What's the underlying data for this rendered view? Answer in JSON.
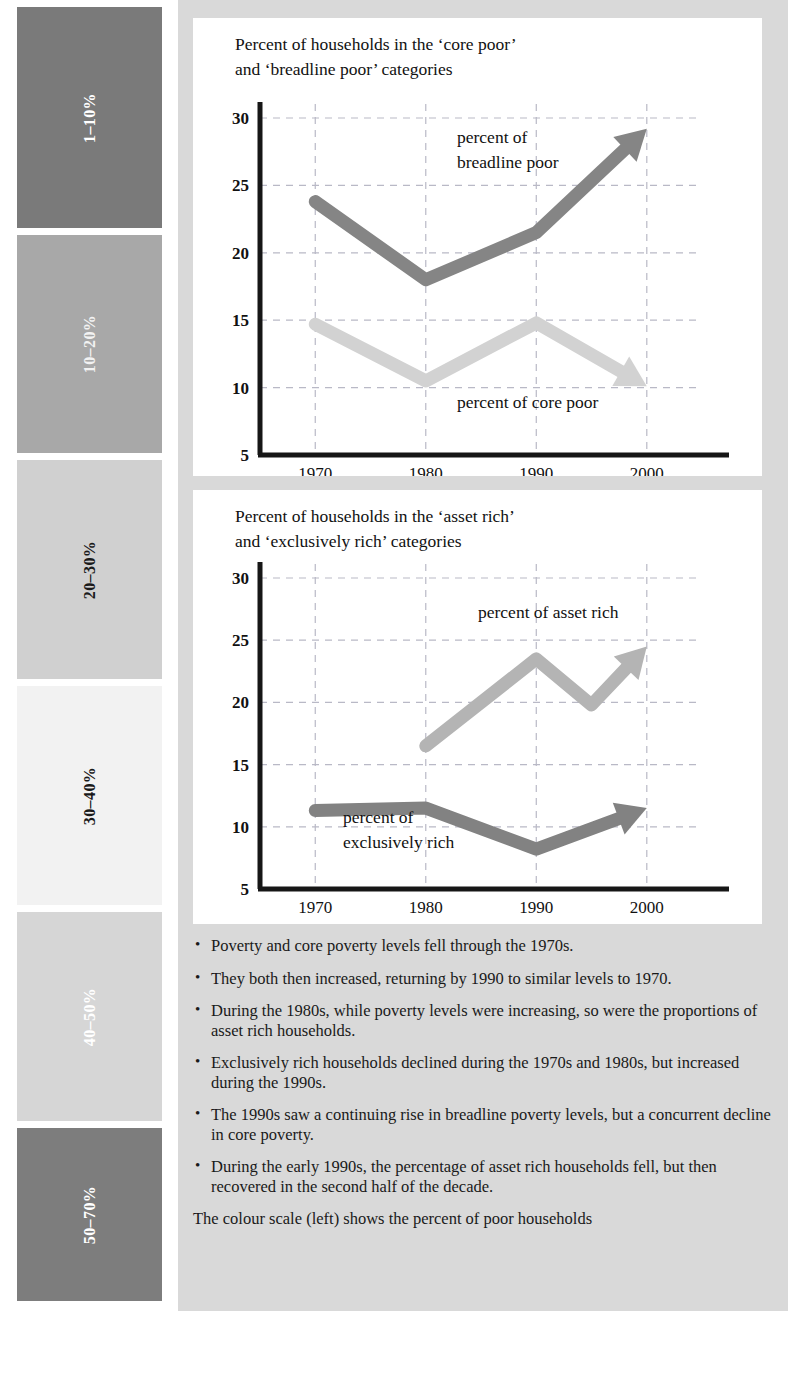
{
  "colour_scale": {
    "bands": [
      {
        "label": "1–10%",
        "color": "#7a7a7a",
        "text_color": "#ffffff",
        "top": 0,
        "height": 221
      },
      {
        "label": "10–20%",
        "color": "#a8a8a8",
        "text_color": "#f2f2f2",
        "top": 228,
        "height": 218
      },
      {
        "label": "20–30%",
        "color": "#d0d0d0",
        "text_color": "#1a1a1a",
        "top": 453,
        "height": 219
      },
      {
        "label": "30–40%",
        "color": "#f2f2f2",
        "text_color": "#1a1a1a",
        "top": 679,
        "height": 219
      },
      {
        "label": "40–50%",
        "color": "#d6d6d6",
        "text_color": "#ffffff",
        "top": 905,
        "height": 209
      },
      {
        "label": "50–70%",
        "color": "#7d7d7d",
        "text_color": "#ffffff",
        "top": 1121,
        "height": 173
      }
    ]
  },
  "charts": {
    "poor": {
      "title": "Percent of households in the ‘core poor’\nand ‘breadline poor’ categories",
      "annotations": {
        "breadline": "percent of\nbreadline poor",
        "core": "percent of core poor"
      }
    },
    "rich": {
      "title": "Percent of households in the ‘asset rich’\nand ‘exclusively rich’ categories",
      "annotations": {
        "asset": "percent of asset rich",
        "exclusive": "percent of\nexclusively rich"
      }
    }
  },
  "chart_data": [
    {
      "type": "line",
      "title": "Percent of households in the ‘core poor’ and ‘breadline poor’ categories",
      "xlabel": "",
      "ylabel": "",
      "x": [
        1970,
        1980,
        1990,
        2000
      ],
      "xticks": [
        "1970",
        "1980",
        "1990",
        "2000"
      ],
      "yticks": [
        5,
        10,
        15,
        20,
        25,
        30
      ],
      "ylim": [
        5,
        30
      ],
      "xlim": [
        1965,
        2004
      ],
      "grid": true,
      "legend": "inline-annotations",
      "series": [
        {
          "name": "percent of breadline poor",
          "color": "#858585",
          "arrow_end": true,
          "values": [
            23.8,
            18.0,
            21.5,
            29.2
          ]
        },
        {
          "name": "percent of core poor",
          "color": "#d2d2d2",
          "arrow_end": true,
          "values": [
            14.7,
            10.5,
            14.8,
            10.1
          ]
        }
      ]
    },
    {
      "type": "line",
      "title": "Percent of households in the ‘asset rich’ and ‘exclusively rich’ categories",
      "xlabel": "",
      "ylabel": "",
      "x": [
        1970,
        1980,
        1990,
        1995,
        2000
      ],
      "xticks": [
        "1970",
        "1980",
        "1990",
        "2000"
      ],
      "yticks": [
        5,
        10,
        15,
        20,
        25,
        30
      ],
      "ylim": [
        5,
        30
      ],
      "xlim": [
        1965,
        2004
      ],
      "grid": true,
      "legend": "inline-annotations",
      "series": [
        {
          "name": "percent of asset rich",
          "color": "#b4b4b4",
          "arrow_end": true,
          "values": [
            null,
            16.5,
            23.5,
            19.8,
            24.5
          ]
        },
        {
          "name": "percent of exclusively rich",
          "color": "#828282",
          "arrow_end": true,
          "values": [
            11.3,
            11.5,
            8.2,
            null,
            11.5
          ]
        }
      ]
    }
  ],
  "notes": {
    "items": [
      "Poverty and core poverty levels fell through the 1970s.",
      "They both then increased, returning by 1990 to similar levels to 1970.",
      "During the 1980s, while poverty levels were increasing, so were the proportions of asset rich households.",
      "Exclusively rich households declined during the 1970s and 1980s, but increased during the 1990s.",
      "The 1990s saw a continuing rise in breadline poverty levels, but a concurrent decline in core poverty.",
      "During the early 1990s, the percentage of asset rich households fell, but then recovered in the second half of the decade."
    ],
    "bullet": "•",
    "footer": "The colour scale (left) shows the percent of poor households"
  }
}
